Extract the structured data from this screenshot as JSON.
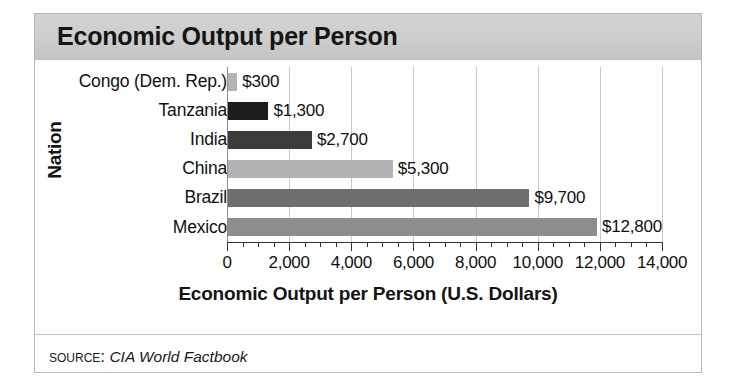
{
  "figure": {
    "title": "Economic Output per Person",
    "source_kicker": "Source:",
    "source_value": "CIA World Factbook"
  },
  "chart_data": {
    "type": "bar",
    "orientation": "horizontal",
    "title": "Economic Output per Person",
    "xlabel": "Economic Output per Person (U.S. Dollars)",
    "ylabel": "Nation",
    "xlim": [
      0,
      14000
    ],
    "xticks": [
      0,
      2000,
      4000,
      6000,
      8000,
      10000,
      12000,
      14000
    ],
    "xticklabels": [
      "0",
      "2,000",
      "4,000",
      "6,000",
      "8,000",
      "10,000",
      "12,000",
      "14,000"
    ],
    "minor_tick_step": 500,
    "grid": "vertical-major",
    "legend": "none",
    "categories": [
      "Congo (Dem. Rep.)",
      "Tanzania",
      "India",
      "China",
      "Brazil",
      "Mexico"
    ],
    "values": [
      300,
      1300,
      2700,
      5300,
      9700,
      12800
    ],
    "value_labels": [
      "$300",
      "$1,300",
      "$2,700",
      "$5,300",
      "$9,700",
      "$12,800"
    ],
    "bar_colors": [
      "#b4b4b4",
      "#1e1e1e",
      "#3c3c3c",
      "#b2b2b2",
      "#6f6f6f",
      "#8d8d8d"
    ],
    "bar_textures": [
      "solid",
      "speckled",
      "speckled",
      "solid",
      "solid",
      "textured"
    ],
    "bars": [
      {
        "category": "Congo (Dem. Rep.)",
        "value": 300,
        "label": "$300",
        "color": "#b4b4b4",
        "texture": "solid"
      },
      {
        "category": "Tanzania",
        "value": 1300,
        "label": "$1,300",
        "color": "#1e1e1e",
        "texture": "speckled"
      },
      {
        "category": "India",
        "value": 2700,
        "label": "$2,700",
        "color": "#3c3c3c",
        "texture": "speckled"
      },
      {
        "category": "China",
        "value": 5300,
        "label": "$5,300",
        "color": "#b2b2b2",
        "texture": "solid"
      },
      {
        "category": "Brazil",
        "value": 9700,
        "label": "$9,700",
        "color": "#6f6f6f",
        "texture": "solid"
      },
      {
        "category": "Mexico",
        "value": 12800,
        "label": "$12,800",
        "color": "#8d8d8d",
        "texture": "textured"
      }
    ]
  }
}
